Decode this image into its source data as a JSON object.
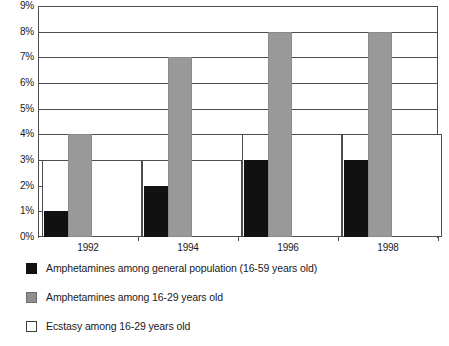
{
  "chart_data": {
    "type": "bar",
    "title": "",
    "subtitle": "",
    "xlabel": "",
    "ylabel": "",
    "categories": [
      "1992",
      "1994",
      "1996",
      "1998"
    ],
    "ylim": [
      0,
      9
    ],
    "ytick_labels": [
      "0%",
      "1%",
      "2%",
      "3%",
      "4%",
      "5%",
      "6%",
      "7%",
      "8%",
      "9%"
    ],
    "ytick_values": [
      0,
      1,
      2,
      3,
      4,
      5,
      6,
      7,
      8,
      9
    ],
    "grid": true,
    "legend_position": "bottom-left",
    "series": [
      {
        "name": "Amphetamines among general population (16-59 years old)",
        "color": "#111111",
        "values": [
          1,
          2,
          3,
          3
        ]
      },
      {
        "name": "Amphetamines among 16-29 years old",
        "color": "#999999",
        "values": [
          4,
          7,
          8,
          8
        ]
      },
      {
        "name": "Ecstasy among 16-29 years old",
        "color": "#ffffff",
        "values": [
          3,
          3,
          4,
          4
        ]
      }
    ]
  },
  "axis": {
    "y_labels": [
      "9%",
      "8%",
      "7%",
      "6%",
      "5%",
      "4%",
      "3%",
      "2%",
      "1%",
      "0%"
    ],
    "x_labels": [
      "1992",
      "1994",
      "1996",
      "1998"
    ]
  },
  "legend": {
    "items": [
      {
        "label": "Amphetamines among general population (16-59 years old)",
        "swatch": "black"
      },
      {
        "label": "Amphetamines among 16-29 years old",
        "swatch": "gray"
      },
      {
        "label": "Ecstasy among 16-29 years old",
        "swatch": "white"
      }
    ]
  },
  "colors": {
    "series_black": "#111111",
    "series_gray": "#999999",
    "series_white": "#ffffff",
    "axis": "#4d4d4d",
    "text": "#1a1a1a"
  }
}
